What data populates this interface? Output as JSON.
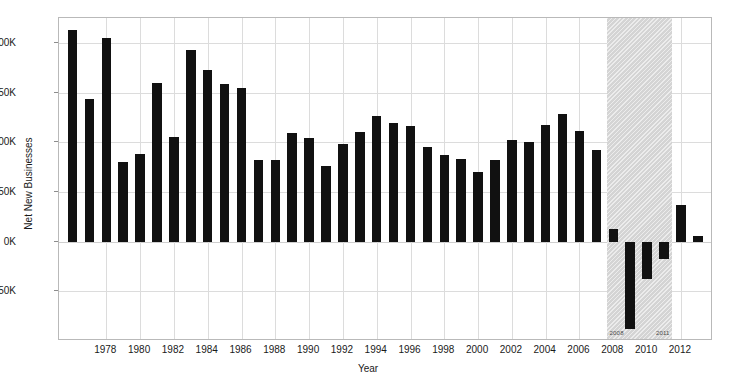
{
  "chart_data": {
    "type": "bar",
    "title": "",
    "xlabel": "Year",
    "ylabel": "Net New Businesses",
    "ylim": [
      -100000,
      225000
    ],
    "xlim": [
      1975.2,
      1913.0
    ],
    "grid": true,
    "legend": false,
    "yticks": [
      {
        "value": 200000,
        "label": "200K"
      },
      {
        "value": 150000,
        "label": "150K"
      },
      {
        "value": 100000,
        "label": "100K"
      },
      {
        "value": 50000,
        "label": "50K"
      },
      {
        "value": 0,
        "label": "0K"
      },
      {
        "value": -50000,
        "label": "-50K"
      }
    ],
    "xticks": [
      {
        "value": 1978,
        "label": "1978"
      },
      {
        "value": 1980,
        "label": "1980"
      },
      {
        "value": 1982,
        "label": "1982"
      },
      {
        "value": 1984,
        "label": "1984"
      },
      {
        "value": 1986,
        "label": "1986"
      },
      {
        "value": 1988,
        "label": "1988"
      },
      {
        "value": 1990,
        "label": "1990"
      },
      {
        "value": 1992,
        "label": "1992"
      },
      {
        "value": 1994,
        "label": "1994"
      },
      {
        "value": 1996,
        "label": "1996"
      },
      {
        "value": 1998,
        "label": "1998"
      },
      {
        "value": 2000,
        "label": "2000"
      },
      {
        "value": 2002,
        "label": "2002"
      },
      {
        "value": 2004,
        "label": "2004"
      },
      {
        "value": 2006,
        "label": "2006"
      },
      {
        "value": 2008,
        "label": "2008"
      },
      {
        "value": 2010,
        "label": "2010"
      },
      {
        "value": 2012,
        "label": "2012"
      }
    ],
    "categories": [
      1976,
      1977,
      1978,
      1979,
      1980,
      1981,
      1982,
      1983,
      1984,
      1985,
      1986,
      1987,
      1988,
      1989,
      1990,
      1991,
      1992,
      1993,
      1994,
      1995,
      1996,
      1997,
      1998,
      1999,
      2000,
      2001,
      2002,
      2003,
      2004,
      2005,
      2006,
      2007,
      2008,
      2009,
      2010,
      2011,
      2012,
      2013
    ],
    "values": [
      213000,
      143000,
      205000,
      80000,
      88000,
      160000,
      105000,
      193000,
      173000,
      159000,
      155000,
      82000,
      82000,
      109000,
      104000,
      76000,
      98000,
      110000,
      126000,
      119000,
      116000,
      95000,
      87000,
      83000,
      70000,
      82000,
      102000,
      100000,
      117000,
      128000,
      111000,
      92000,
      13000,
      -88000,
      -38000,
      -17000,
      37000,
      6000
    ],
    "bar_color": "#111111",
    "annotations": [
      {
        "label": "2008",
        "x": 2008.05,
        "position": "band-start-bottom"
      },
      {
        "label": "2011",
        "x": 2011.05,
        "position": "band-end-bottom"
      }
    ],
    "shaded_regions": [
      {
        "name": "recession-band",
        "x_start": 2007.6,
        "x_end": 2011.45,
        "color": "#d4d4d4",
        "hatch": "diagonal"
      }
    ]
  }
}
